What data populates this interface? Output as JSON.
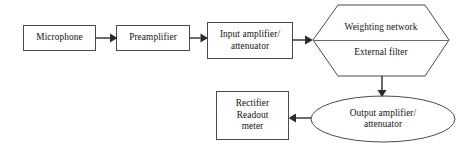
{
  "diagram": {
    "background_color": "#ffffff",
    "box_stroke_color": "#4a4a4a",
    "arrow_color": "#2b2b2b",
    "text_color": "#111111",
    "nodes": {
      "microphone": {
        "shape": "rectangle",
        "lines": [
          "Microphone"
        ],
        "line1": "Microphone"
      },
      "preamplifier": {
        "shape": "rectangle",
        "lines": [
          "Preamplifier"
        ],
        "line1": "Preamplifier"
      },
      "input_amplifier": {
        "shape": "rectangle",
        "lines": [
          "Input amplifier/",
          "attenuator"
        ],
        "line1": "Input amplifier/",
        "line2": "attenuator"
      },
      "filter_hexagon": {
        "shape": "hexagon",
        "top_label": "Weighting network",
        "bottom_label": "External filter"
      },
      "output_amplifier": {
        "shape": "ellipse",
        "lines": [
          "Output amplifier/",
          "attenuator"
        ],
        "line1": "Output amplifier/",
        "line2": "attenuator"
      },
      "rectifier": {
        "shape": "rectangle",
        "lines": [
          "Rectifier",
          "Readout",
          "meter"
        ],
        "line1": "Rectifier",
        "line2": "Readout",
        "line3": "meter"
      }
    },
    "connections": [
      {
        "from": "microphone",
        "to": "preamplifier",
        "direction": "right"
      },
      {
        "from": "preamplifier",
        "to": "input_amplifier",
        "direction": "right"
      },
      {
        "from": "input_amplifier",
        "to": "filter_hexagon",
        "direction": "right"
      },
      {
        "from": "filter_hexagon",
        "to": "output_amplifier",
        "direction": "down"
      },
      {
        "from": "output_amplifier",
        "to": "rectifier",
        "direction": "left"
      }
    ]
  }
}
